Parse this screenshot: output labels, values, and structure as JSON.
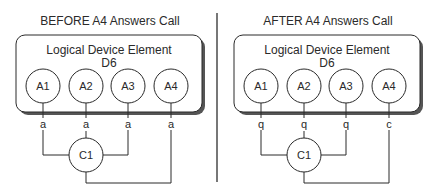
{
  "panels": [
    {
      "title": "BEFORE A4 Answers Call",
      "box_label_line1": "Logical Device Element",
      "box_label_line2": "D6",
      "nodes": [
        "A1",
        "A2",
        "A3",
        "A4"
      ],
      "states": [
        "a",
        "a",
        "a",
        "a"
      ],
      "connector": "C1"
    },
    {
      "title": "AFTER A4 Answers Call",
      "box_label_line1": "Logical Device Element",
      "box_label_line2": "D6",
      "nodes": [
        "A1",
        "A2",
        "A3",
        "A4"
      ],
      "states": [
        "q",
        "q",
        "q",
        "c"
      ],
      "connector": "C1"
    }
  ],
  "colors": {
    "line": "#2a2a2a",
    "shadow": "#555555",
    "divider": "#777777"
  }
}
